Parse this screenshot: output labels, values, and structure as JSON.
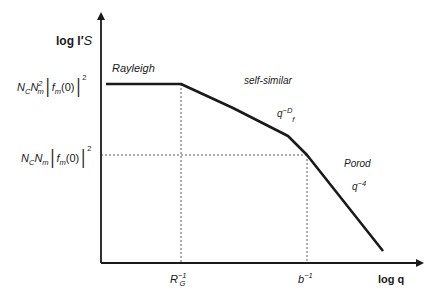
{
  "diagram": {
    "type": "log-log scattering curve schematic",
    "y_axis_label": "log I′S",
    "x_axis_label": "log q",
    "y_ticks": [
      {
        "label": "N_C N_m^2 |f_m(0)|^2",
        "parts": {
          "a": "N",
          "a_sub": "C",
          "b": "N",
          "b_sub": "m",
          "b_sup": "2",
          "f": "f",
          "f_sub": "m",
          "arg": "(0)",
          "pow": "2"
        }
      },
      {
        "label": "N_C N_m |f_m(0)|^2",
        "parts": {
          "a": "N",
          "a_sub": "C",
          "b": "N",
          "b_sub": "m",
          "f": "f",
          "f_sub": "m",
          "arg": "(0)",
          "pow": "2"
        }
      }
    ],
    "x_ticks": [
      {
        "label": "R_G^-1",
        "base": "R",
        "sub": "G",
        "sup": "−1"
      },
      {
        "label": "b^-1",
        "base": "b",
        "sup": "−1"
      }
    ],
    "regions": [
      {
        "name": "Rayleigh",
        "exponent": ""
      },
      {
        "name": "self-similar",
        "exponent_base": "q",
        "exponent": "−D",
        "exponent_sub": "f"
      },
      {
        "name": "Porod",
        "exponent_base": "q",
        "exponent": "−4"
      }
    ],
    "curve_points": [
      [
        106,
        84
      ],
      [
        181,
        84
      ],
      [
        233,
        108
      ],
      [
        288,
        136
      ],
      [
        307,
        155
      ],
      [
        383,
        251
      ]
    ]
  },
  "y_label": {
    "prefix": "log I",
    "prime": "′",
    "s": "S"
  },
  "x_label": "log q"
}
